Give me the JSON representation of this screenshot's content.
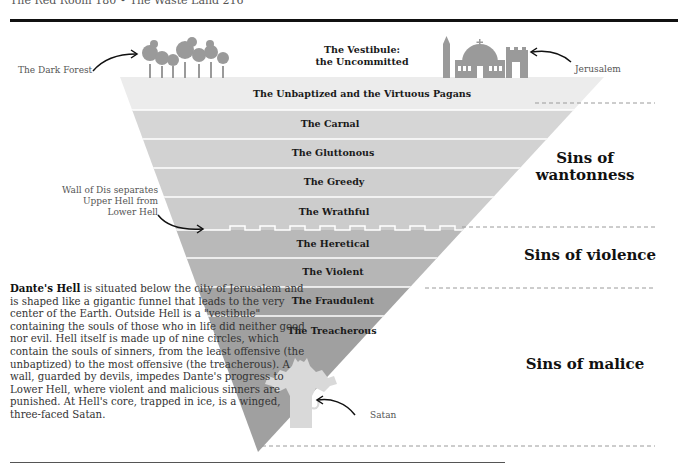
{
  "header": {
    "running_head": "The Red Room 180  •  The Waste Land 216"
  },
  "vestibule": {
    "line1": "The Vestibule:",
    "line2": "the Uncommitted"
  },
  "callouts": {
    "dark_forest": "The Dark Forest",
    "jerusalem": "Jerusalem",
    "wall_line1": "Wall of Dis separates",
    "wall_line2": "Upper Hell from",
    "wall_line3": "Lower Hell",
    "satan": "Satan"
  },
  "circles": [
    {
      "label": "The Unbaptized and the Virtuous Pagans",
      "color": "#ececec"
    },
    {
      "label": "The Carnal",
      "color": "#d6d6d6"
    },
    {
      "label": "The Gluttonous",
      "color": "#d2d2d2"
    },
    {
      "label": "The Greedy",
      "color": "#cfcfcf"
    },
    {
      "label": "The Wrathful",
      "color": "#cccccc"
    },
    {
      "label": "The Heretical",
      "color": "#b9b9b9"
    },
    {
      "label": "The Violent",
      "color": "#b6b6b6"
    },
    {
      "label": "The Fraudulent",
      "color": "#a3a3a3"
    },
    {
      "label": "The Treacherous",
      "color": "#a0a0a0"
    }
  ],
  "sins": {
    "wantonness_line1": "Sins of",
    "wantonness_line2": "wantonness",
    "violence": "Sins of violence",
    "malice": "Sins of malice"
  },
  "description": {
    "lead": "Dante's Hell",
    "body": " is situated below the city of Jerusalem and is shaped like a gigantic funnel that leads to the very center of the Earth. Outside Hell is a \"vestibule\" containing the souls of those who in life did neither good nor evil. Hell itself is made up of nine circles, which contain the souls of sinners, from the least offensive (the unbaptized) to the most offensive (the treacherous). A wall, guarded by devils, impedes Dante's progress to Lower Hell, where violent and malicious sinners are punished. At Hell's core, trapped in ice, is a winged, three-faced Satan."
  },
  "colors": {
    "icon_gray": "#9a9a9a",
    "satan_fill": "#d9d9d9",
    "text_dark": "#1a1a1a",
    "dash": "#9a9a9a"
  }
}
